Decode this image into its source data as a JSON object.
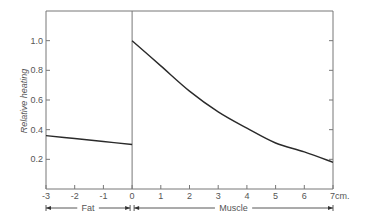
{
  "chart_data": {
    "type": "line",
    "title": "",
    "xlabel": "",
    "xunit": "cm.",
    "ylabel": "Relative heating",
    "xlim": [
      -3,
      7
    ],
    "ylim": [
      0,
      1.2
    ],
    "grid": false,
    "x_ticks": [
      -3,
      -2,
      -1,
      0,
      1,
      2,
      3,
      4,
      5,
      6,
      7
    ],
    "x_tick_labels": [
      "-3",
      "-2",
      "-1",
      "0",
      "1",
      "2",
      "3",
      "4",
      "5",
      "6",
      "7cm."
    ],
    "y_ticks": [
      0.2,
      0.4,
      0.6,
      0.8,
      1.0
    ],
    "y_tick_labels": [
      "0.2",
      "0.4",
      "0.6",
      "0.8",
      "1.0"
    ],
    "regions": [
      {
        "name": "Fat",
        "from": -3,
        "to": 0
      },
      {
        "name": "Muscle",
        "from": 0,
        "to": 7
      }
    ],
    "series": [
      {
        "name": "Fat",
        "x": [
          -3,
          -2,
          -1,
          0
        ],
        "values": [
          0.36,
          0.34,
          0.32,
          0.3
        ]
      },
      {
        "name": "Muscle",
        "x": [
          0,
          1,
          2,
          3,
          4,
          5,
          6,
          7
        ],
        "values": [
          1.0,
          0.83,
          0.66,
          0.52,
          0.41,
          0.31,
          0.25,
          0.18
        ]
      }
    ]
  },
  "labels": {
    "ylabel": "Relative heating",
    "fat": "Fat",
    "muscle": "Muscle"
  },
  "colors": {
    "line": "#2a2a2a",
    "axis": "#777777",
    "text": "#555555"
  }
}
